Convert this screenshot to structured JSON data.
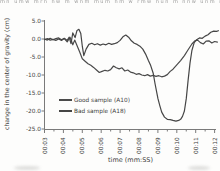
{
  "artifacts": {
    "top_cropped_text": "mn umw mrn nw m wnm mum nm w rmw nun m nnw unm n mw nwm mnu w nm mwn um n"
  },
  "chart_data": {
    "type": "line",
    "title": "",
    "xlabel": "time (mm:SS)",
    "ylabel": "change in the center of gravity (cm)",
    "xlim": [
      3,
      12.3
    ],
    "ylim": [
      -25,
      5
    ],
    "grid": false,
    "legend_position": "inside-lower-left",
    "axis_color": "#7a7a7a",
    "tick_color": "#7a7a7a",
    "text_color": "#3d3d3d",
    "x_tick_values": [
      3,
      4,
      5,
      6,
      7,
      8,
      9,
      10,
      11,
      12
    ],
    "x_tick_labels": [
      "00:03",
      "00:04",
      "00:05",
      "00:06",
      "00:07",
      "00:08",
      "00:09",
      "00:10",
      "00:11",
      "00:12"
    ],
    "x_minor_tick_values": [
      3.5,
      4.5,
      5.5,
      6.5,
      7.5,
      8.5,
      9.5,
      10.5,
      11.5
    ],
    "y_tick_values": [
      5,
      0,
      -5,
      -10,
      -15,
      -20,
      -25
    ],
    "y_tick_labels": [
      "5.0",
      "0.0",
      "-5.0",
      "-10.0",
      "-15.0",
      "-20.0",
      "-25.0"
    ],
    "series": [
      {
        "name": "Good sample (A10)",
        "color": "#4a4a4a",
        "points": [
          [
            3.0,
            -0.2
          ],
          [
            3.15,
            0.1
          ],
          [
            3.3,
            -0.3
          ],
          [
            3.45,
            -0.1
          ],
          [
            3.6,
            -0.4
          ],
          [
            3.75,
            0.0
          ],
          [
            3.9,
            -0.4
          ],
          [
            4.05,
            0.1
          ],
          [
            4.2,
            -0.8
          ],
          [
            4.35,
            0.5
          ],
          [
            4.5,
            -1.6
          ],
          [
            4.6,
            -0.3
          ],
          [
            4.72,
            -1.8
          ],
          [
            4.85,
            -3.5
          ],
          [
            5.0,
            -5.5
          ],
          [
            5.15,
            -6.2
          ],
          [
            5.3,
            -6.9
          ],
          [
            5.45,
            -7.3
          ],
          [
            5.6,
            -7.9
          ],
          [
            5.75,
            -8.6
          ],
          [
            5.9,
            -9.3
          ],
          [
            6.05,
            -9.0
          ],
          [
            6.2,
            -8.7
          ],
          [
            6.35,
            -8.9
          ],
          [
            6.5,
            -8.5
          ],
          [
            6.65,
            -7.5
          ],
          [
            6.8,
            -8.0
          ],
          [
            6.95,
            -8.3
          ],
          [
            7.1,
            -8.0
          ],
          [
            7.25,
            -8.9
          ],
          [
            7.4,
            -8.6
          ],
          [
            7.55,
            -9.2
          ],
          [
            7.7,
            -9.4
          ],
          [
            7.85,
            -9.8
          ],
          [
            8.0,
            -9.6
          ],
          [
            8.15,
            -10.0
          ],
          [
            8.3,
            -10.2
          ],
          [
            8.45,
            -9.9
          ],
          [
            8.6,
            -10.3
          ],
          [
            8.75,
            -10.1
          ],
          [
            8.9,
            -10.4
          ],
          [
            9.05,
            -10.2
          ],
          [
            9.2,
            -10.5
          ],
          [
            9.35,
            -10.3
          ],
          [
            9.5,
            -9.9
          ],
          [
            9.65,
            -9.0
          ],
          [
            9.8,
            -8.4
          ],
          [
            10.0,
            -7.2
          ],
          [
            10.2,
            -6.0
          ],
          [
            10.4,
            -4.6
          ],
          [
            10.6,
            -3.0
          ],
          [
            10.8,
            -1.4
          ],
          [
            10.95,
            -0.5
          ],
          [
            11.1,
            -0.3
          ],
          [
            11.25,
            -1.0
          ],
          [
            11.4,
            -1.4
          ],
          [
            11.55,
            -0.6
          ],
          [
            11.7,
            -0.5
          ],
          [
            11.85,
            -1.1
          ],
          [
            12.0,
            -0.7
          ],
          [
            12.15,
            -0.9
          ]
        ]
      },
      {
        "name": "Bad sample (A18)",
        "color": "#454545",
        "points": [
          [
            3.0,
            0.0
          ],
          [
            3.15,
            -0.3
          ],
          [
            3.3,
            0.2
          ],
          [
            3.45,
            -0.2
          ],
          [
            3.6,
            0.1
          ],
          [
            3.75,
            0.3
          ],
          [
            3.9,
            -0.2
          ],
          [
            4.05,
            0.2
          ],
          [
            4.2,
            -0.4
          ],
          [
            4.3,
            0.5
          ],
          [
            4.4,
            -1.3
          ],
          [
            4.5,
            1.7
          ],
          [
            4.62,
            0.4
          ],
          [
            4.72,
            2.4
          ],
          [
            4.82,
            2.7
          ],
          [
            4.92,
            1.5
          ],
          [
            5.0,
            -2.0
          ],
          [
            5.08,
            -4.6
          ],
          [
            5.2,
            -2.8
          ],
          [
            5.35,
            -1.5
          ],
          [
            5.5,
            -1.2
          ],
          [
            5.65,
            -1.6
          ],
          [
            5.8,
            -1.3
          ],
          [
            5.95,
            -1.7
          ],
          [
            6.1,
            -1.4
          ],
          [
            6.25,
            -1.6
          ],
          [
            6.4,
            -1.2
          ],
          [
            6.55,
            -1.5
          ],
          [
            6.7,
            -1.3
          ],
          [
            6.85,
            -1.0
          ],
          [
            7.0,
            -0.4
          ],
          [
            7.15,
            0.6
          ],
          [
            7.3,
            1.1
          ],
          [
            7.45,
            0.5
          ],
          [
            7.6,
            -0.5
          ],
          [
            7.75,
            -1.2
          ],
          [
            7.9,
            -1.5
          ],
          [
            8.05,
            -2.0
          ],
          [
            8.2,
            -2.8
          ],
          [
            8.35,
            -4.2
          ],
          [
            8.5,
            -6.0
          ],
          [
            8.62,
            -7.4
          ],
          [
            8.75,
            -9.5
          ],
          [
            8.85,
            -12.5
          ],
          [
            9.0,
            -16.5
          ],
          [
            9.1,
            -18.5
          ],
          [
            9.2,
            -20.3
          ],
          [
            9.35,
            -21.7
          ],
          [
            9.5,
            -22.3
          ],
          [
            9.65,
            -22.4
          ],
          [
            9.8,
            -22.6
          ],
          [
            9.95,
            -22.8
          ],
          [
            10.1,
            -22.6
          ],
          [
            10.2,
            -22.3
          ],
          [
            10.3,
            -21.5
          ],
          [
            10.4,
            -20.0
          ],
          [
            10.5,
            -16.5
          ],
          [
            10.6,
            -11.5
          ],
          [
            10.7,
            -6.7
          ],
          [
            10.8,
            -3.2
          ],
          [
            10.92,
            -1.0
          ],
          [
            11.05,
            -0.2
          ],
          [
            11.2,
            0.3
          ],
          [
            11.35,
            0.2
          ],
          [
            11.5,
            0.8
          ],
          [
            11.65,
            1.2
          ],
          [
            11.8,
            1.9
          ],
          [
            11.95,
            2.2
          ],
          [
            12.1,
            2.1
          ],
          [
            12.2,
            2.3
          ]
        ]
      }
    ]
  }
}
